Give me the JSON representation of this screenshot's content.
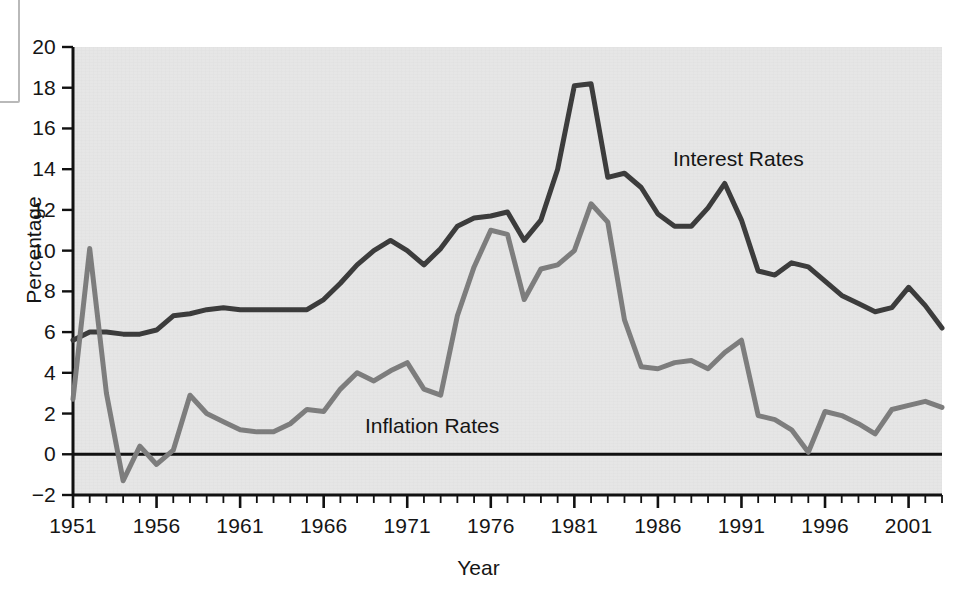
{
  "chart_data": {
    "type": "line",
    "title": "",
    "xlabel": "Year",
    "ylabel": "Percentage",
    "xlim": [
      1951,
      2003
    ],
    "ylim": [
      -2,
      20
    ],
    "yticks": [
      -2,
      0,
      2,
      4,
      6,
      8,
      10,
      12,
      14,
      16,
      18,
      20
    ],
    "ytick_labels": [
      "−2",
      "0",
      "2",
      "4",
      "6",
      "8",
      "10",
      "12",
      "14",
      "16",
      "18",
      "20"
    ],
    "xticks_major": [
      1951,
      1956,
      1961,
      1966,
      1971,
      1976,
      1981,
      1986,
      1991,
      1996,
      2001
    ],
    "xtick_labels": [
      "1951",
      "1956",
      "1961",
      "1966",
      "1971",
      "1976",
      "1981",
      "1986",
      "1991",
      "1996",
      "2001"
    ],
    "xtick_minor_step": 1,
    "grid": false,
    "legend_position": "inline-annotations",
    "zero_line": 0,
    "x": [
      1951,
      1952,
      1953,
      1954,
      1955,
      1956,
      1957,
      1958,
      1959,
      1960,
      1961,
      1962,
      1963,
      1964,
      1965,
      1966,
      1967,
      1968,
      1969,
      1970,
      1971,
      1972,
      1973,
      1974,
      1975,
      1976,
      1977,
      1978,
      1979,
      1980,
      1981,
      1982,
      1983,
      1984,
      1985,
      1986,
      1987,
      1988,
      1989,
      1990,
      1991,
      1992,
      1993,
      1994,
      1995,
      1996,
      1997,
      1998,
      1999,
      2000,
      2001,
      2002,
      2003
    ],
    "series": [
      {
        "name": "Interest Rates",
        "color": "#3c3c3c",
        "label_x": 1988.5,
        "label_y": 14.6,
        "values": [
          5.6,
          6.0,
          6.0,
          5.9,
          5.9,
          6.1,
          6.8,
          6.9,
          7.1,
          7.2,
          7.1,
          7.1,
          7.1,
          7.1,
          7.1,
          7.6,
          8.4,
          9.3,
          10.0,
          10.5,
          10.0,
          9.3,
          10.1,
          11.2,
          11.6,
          11.7,
          11.9,
          10.5,
          11.5,
          14.0,
          18.1,
          18.2,
          13.6,
          13.8,
          13.1,
          11.8,
          11.2,
          11.2,
          12.1,
          13.3,
          11.5,
          9.0,
          8.8,
          9.4,
          9.2,
          8.5,
          7.8,
          7.4,
          7.0,
          7.2,
          8.2,
          7.3,
          6.2
        ]
      },
      {
        "name": "Inflation Rates",
        "color": "#7d7d7d",
        "label_x": 1967.5,
        "label_y": 2.3,
        "values": [
          2.7,
          10.1,
          3.0,
          -1.3,
          0.4,
          -0.5,
          0.2,
          2.9,
          2.0,
          1.6,
          1.2,
          1.1,
          1.1,
          1.5,
          2.2,
          2.1,
          3.2,
          4.0,
          3.6,
          4.1,
          4.5,
          3.2,
          2.9,
          6.8,
          9.2,
          11.0,
          10.8,
          7.6,
          9.1,
          9.3,
          10.0,
          12.3,
          11.4,
          6.6,
          4.3,
          4.2,
          4.5,
          4.6,
          4.2,
          5.0,
          5.6,
          1.9,
          1.7,
          1.2,
          0.1,
          2.1,
          1.9,
          1.5,
          1.0,
          2.2,
          2.4,
          2.6,
          2.3
        ]
      }
    ]
  },
  "annotations": {
    "interest_label": "Interest Rates",
    "inflation_label": "Inflation Rates"
  }
}
